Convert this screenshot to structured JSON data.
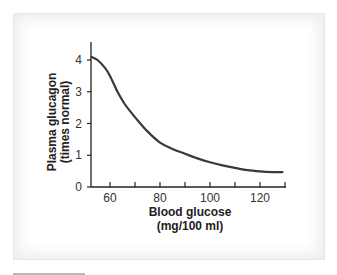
{
  "chart_data": {
    "type": "line",
    "title": "",
    "xlabel": "Blood glucose",
    "xlabel_units": "(mg/100 ml)",
    "ylabel": "Plasma glucagon",
    "ylabel_units": "(times normal)",
    "xlim": [
      52,
      130
    ],
    "ylim": [
      0,
      4.5
    ],
    "x_ticks": [
      60,
      70,
      80,
      90,
      100,
      110,
      120,
      130
    ],
    "x_tick_labels": [
      "60",
      "",
      "80",
      "",
      "100",
      "",
      "120",
      ""
    ],
    "y_ticks": [
      0,
      1,
      2,
      3,
      4
    ],
    "y_tick_labels": [
      "0",
      "1",
      "2",
      "3",
      "4"
    ],
    "grid": false,
    "legend": null,
    "series": [
      {
        "name": "Plasma glucagon",
        "color": "#3a3a3a",
        "x": [
          52.5,
          55,
          58,
          60,
          63,
          66,
          70,
          75,
          80,
          85,
          90,
          95,
          100,
          105,
          110,
          115,
          120,
          125,
          129
        ],
        "y": [
          4.1,
          4.0,
          3.75,
          3.5,
          3.0,
          2.6,
          2.2,
          1.75,
          1.4,
          1.2,
          1.05,
          0.9,
          0.78,
          0.68,
          0.6,
          0.53,
          0.49,
          0.47,
          0.47
        ]
      }
    ]
  },
  "labels": {
    "y_title_line1": "Plasma glucagon",
    "y_title_line2": "(times normal)",
    "x_title_line1": "Blood glucose",
    "x_title_line2": "(mg/100 ml)",
    "y_ticks": [
      "0",
      "1",
      "2",
      "3",
      "4"
    ],
    "x_ticks": [
      "60",
      "80",
      "100",
      "120"
    ]
  },
  "colors": {
    "axis": "#222222",
    "curve": "#3a3a3a",
    "frame_border": "#e6e6e6"
  }
}
